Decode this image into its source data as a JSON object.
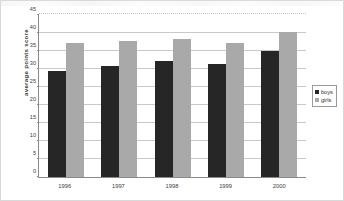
{
  "chart_data": {
    "type": "bar",
    "title": "",
    "xlabel": "",
    "ylabel": "average points score",
    "categories": [
      "1996",
      "1997",
      "1998",
      "1999",
      "2000"
    ],
    "series": [
      {
        "name": "boys",
        "color": "#262626",
        "values": [
          29.5,
          30.8,
          32.2,
          31.5,
          35.0
        ]
      },
      {
        "name": "girls",
        "color": "#a9a9a9",
        "values": [
          37.2,
          37.8,
          38.3,
          37.2,
          40.3
        ]
      }
    ],
    "ylim": [
      0,
      45
    ],
    "ytick_step": 5,
    "yticks": [
      "45",
      "40",
      "35",
      "30",
      "25",
      "20",
      "15",
      "10",
      "5",
      "0"
    ],
    "grid": true,
    "legend_position": "right"
  },
  "legend": {
    "items": [
      {
        "label": "boys",
        "color": "#262626"
      },
      {
        "label": "girls",
        "color": "#a9a9a9"
      }
    ]
  }
}
